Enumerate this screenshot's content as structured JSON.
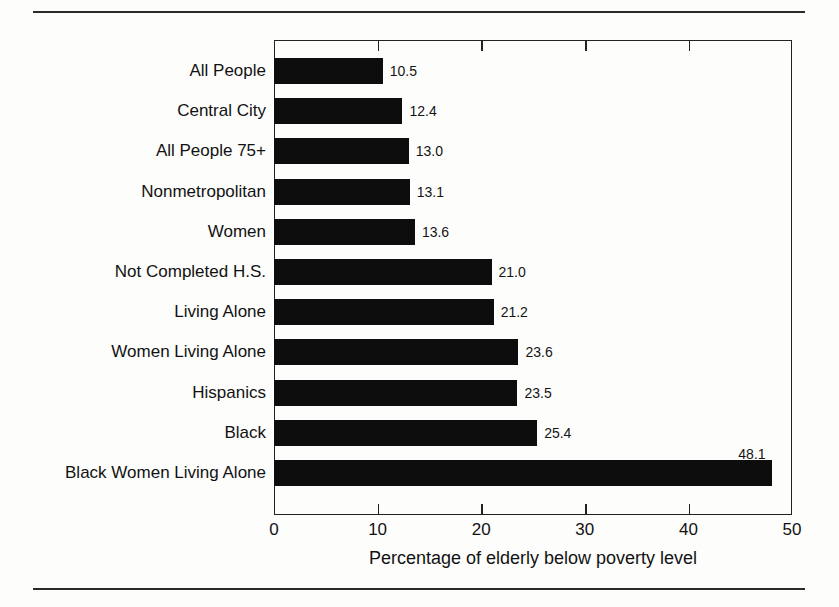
{
  "chart_data": {
    "type": "bar",
    "orientation": "horizontal",
    "title": "",
    "xlabel": "Percentage of elderly below poverty level",
    "ylabel": "",
    "xlim": [
      0,
      50
    ],
    "xticks": [
      0,
      10,
      20,
      30,
      40,
      50
    ],
    "xtick_labels": [
      "0",
      "10",
      "20",
      "30",
      "40",
      "50"
    ],
    "grid": false,
    "legend": null,
    "bar_color": "#0d0d0d",
    "categories": [
      "All People",
      "Central City",
      "All People 75+",
      "Nonmetropolitan",
      "Women",
      "Not Completed H.S.",
      "Living Alone",
      "Women Living Alone",
      "Hispanics",
      "Black",
      "Black Women Living Alone"
    ],
    "values": [
      10.5,
      12.4,
      13.0,
      13.1,
      13.6,
      21.0,
      21.2,
      23.6,
      23.5,
      25.4,
      48.1
    ],
    "value_labels": [
      "10.5",
      "12.4",
      "13.0",
      "13.1",
      "13.6",
      "21.0",
      "21.2",
      "23.6",
      "23.5",
      "25.4",
      "48.1"
    ]
  }
}
